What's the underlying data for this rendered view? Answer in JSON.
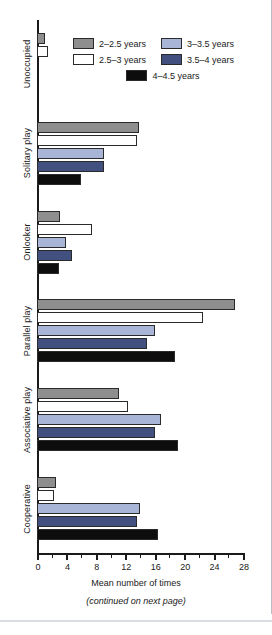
{
  "figure": {
    "continued_note": "(continued on next page)"
  },
  "legend": {
    "entries": [
      {
        "label": "2–2.5 years",
        "color": "#8e8e8e",
        "swatch": "legend-swatch-gray"
      },
      {
        "label": "3–3.5 years",
        "color": "#a8b5d6",
        "swatch": "legend-swatch-light-blue"
      },
      {
        "label": "2.5–3 years",
        "color": "#ffffff",
        "swatch": "legend-swatch-white"
      },
      {
        "label": "3.5–4 years",
        "color": "#41507e",
        "swatch": "legend-swatch-dark-blue"
      },
      {
        "label": "4–4.5 years",
        "color": "#0d0d0d",
        "swatch": "legend-swatch-black"
      }
    ]
  },
  "chart_data": {
    "type": "bar",
    "orientation": "horizontal",
    "title": "",
    "xlabel": "Mean number of times",
    "ylabel": "",
    "xlim": [
      0,
      28
    ],
    "xticks": [
      0,
      4,
      8,
      12,
      16,
      20,
      24,
      28
    ],
    "xtick_labels": [
      "0",
      "4",
      "8",
      "12",
      "16",
      "20",
      "24",
      "28"
    ],
    "minor_tick_step": 2,
    "grid": false,
    "legend_position": "top-right",
    "categories": [
      "Unoccupied",
      "Solitary play",
      "Onlooker",
      "Parallel play",
      "Associative play",
      "Cooperative"
    ],
    "series": [
      {
        "name": "2–2.5 years",
        "color": "#8e8e8e",
        "values": [
          1.1,
          13.8,
          3.1,
          26.9,
          11.1,
          2.6
        ]
      },
      {
        "name": "2.5–3 years",
        "color": "#ffffff",
        "values": [
          1.5,
          13.6,
          7.5,
          22.6,
          12.4,
          2.3
        ]
      },
      {
        "name": "3–3.5 years",
        "color": "#a8b5d6",
        "values": [
          0.0,
          9.1,
          4.0,
          16.0,
          16.8,
          14.0
        ]
      },
      {
        "name": "3.5–4 years",
        "color": "#41507e",
        "values": [
          0.0,
          9.1,
          4.8,
          15.0,
          16.0,
          13.6
        ]
      },
      {
        "name": "4–4.5 years",
        "color": "#0d0d0d",
        "values": [
          0.0,
          6.0,
          3.0,
          18.8,
          19.2,
          16.4
        ]
      }
    ]
  }
}
